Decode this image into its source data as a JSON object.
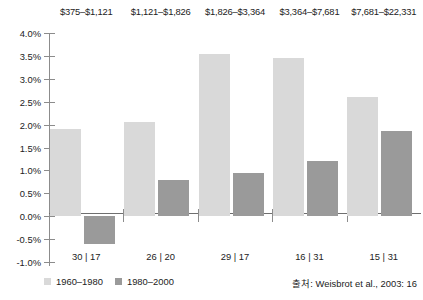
{
  "chart_data": {
    "type": "bar",
    "title": "",
    "subtitle": "",
    "xlabel": "",
    "ylabel": "",
    "ylim": [
      -1.0,
      4.0
    ],
    "ytick_step": 0.5,
    "ytick_labels": [
      "4.0%",
      "3.5%",
      "3.0%",
      "2.5%",
      "2.0%",
      "1.5%",
      "1.0%",
      "0.5%",
      "0.0%",
      "-0.5%",
      "-1.0%"
    ],
    "ytick_values": [
      4.0,
      3.5,
      3.0,
      2.5,
      2.0,
      1.5,
      1.0,
      0.5,
      0.0,
      -0.5,
      -1.0
    ],
    "grid": false,
    "legend_position": "bottom-left",
    "categories": [
      "$375–$1,121",
      "$1,121–$1,826",
      "$1,826–$3,364",
      "$3,364–$7,681",
      "$7,681–$22,331"
    ],
    "category_sublabels": [
      "30 | 17",
      "26 | 20",
      "29 | 17",
      "16 | 31",
      "15 | 31"
    ],
    "series": [
      {
        "name": "1960–1980",
        "color": "#d9d9d9",
        "values": [
          1.9,
          2.05,
          3.55,
          3.45,
          2.6
        ]
      },
      {
        "name": "1980–2000",
        "color": "#9a9a9a",
        "values": [
          -0.6,
          0.8,
          0.95,
          1.2,
          1.85
        ]
      }
    ],
    "source_note": "출처: Weisbrot et al., 2003: 16"
  },
  "colors": {
    "series_1960_1980": "#d9d9d9",
    "series_1980_2000": "#9a9a9a",
    "axis": "#8c8c8c",
    "baseline": "#6f6f6f",
    "text": "#222222",
    "background": "#ffffff"
  }
}
